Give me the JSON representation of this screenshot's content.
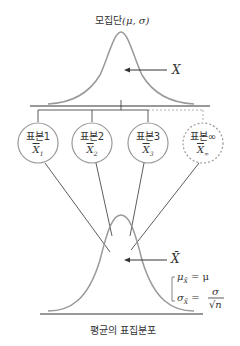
{
  "title": {
    "population_label": "모집단",
    "population_params": "(μ, σ)",
    "population_var": "X"
  },
  "samples": [
    {
      "label": "표본1",
      "mean": "X",
      "sub": "1",
      "dashed": false
    },
    {
      "label": "표본2",
      "mean": "X",
      "sub": "2",
      "dashed": false
    },
    {
      "label": "표본3",
      "mean": "X",
      "sub": "3",
      "dashed": false
    },
    {
      "label": "표본∞",
      "mean": "X",
      "sub": "∞",
      "dashed": true
    }
  ],
  "sampling_dist": {
    "var": "X̄",
    "mean_formula_lhs": "μ",
    "mean_formula_sub": "X̄",
    "mean_formula_rhs": "= μ",
    "sd_formula_lhs": "σ",
    "sd_formula_sub": "X̄",
    "sd_formula_eq": "=",
    "sd_num": "σ",
    "sd_den": "√n",
    "caption": "평균의 표집분포"
  },
  "colors": {
    "curve": "#999999",
    "line": "#333333",
    "dashed": "#999999"
  }
}
